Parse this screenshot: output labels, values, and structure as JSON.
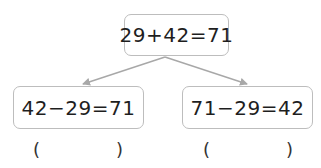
{
  "diagram": {
    "top": {
      "equation": "29+42=71"
    },
    "children": [
      {
        "equation": "42−29=71",
        "answer_blank": {
          "open": "(",
          "close": ")",
          "value": ""
        }
      },
      {
        "equation": "71−29=42",
        "answer_blank": {
          "open": "(",
          "close": ")",
          "value": ""
        }
      }
    ],
    "colors": {
      "box_border": "#bdbdbd",
      "arrow": "#a8a8a8",
      "text": "#1e1e1e"
    }
  }
}
